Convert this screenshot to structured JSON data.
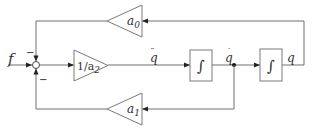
{
  "diagram": {
    "type": "block-diagram",
    "input": {
      "label": "f"
    },
    "summing_junction": {
      "signs": {
        "top": "−",
        "bottom": "−"
      }
    },
    "blocks": {
      "gain_forward": {
        "label": "1/a",
        "subscript": "2"
      },
      "gain_a0": {
        "label": "a",
        "subscript": "0"
      },
      "gain_a1": {
        "label": "a",
        "subscript": "1"
      },
      "integrator_1": {
        "symbol": "∫"
      },
      "integrator_2": {
        "symbol": "∫"
      }
    },
    "signals": {
      "q_ddot": {
        "label": "q",
        "accent": "̈"
      },
      "q_dot": {
        "label": "q",
        "accent": "̇"
      },
      "q": {
        "label": "q"
      }
    },
    "colors": {
      "line": "#6e6e6e",
      "arrow": "#222222",
      "text": "#333333"
    }
  }
}
